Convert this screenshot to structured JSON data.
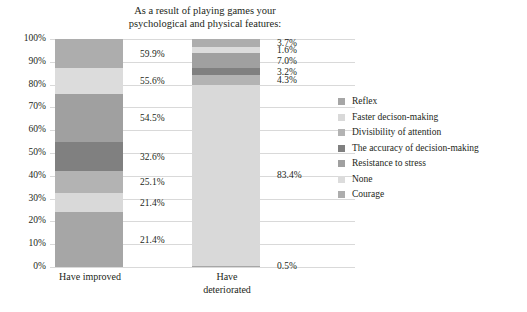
{
  "chart_data": {
    "type": "bar",
    "subtype": "stacked-100-percent",
    "title": "As a result of playing games your psychological and physical features:",
    "title_lines": [
      "As a result of playing games your",
      "psychological and physical features:"
    ],
    "categories": [
      "Have improved",
      "Have deteriorated"
    ],
    "category_lines": [
      [
        "Have improved"
      ],
      [
        "Have",
        "deteriorated"
      ]
    ],
    "xlabel": "",
    "ylabel": "",
    "ylim": [
      0,
      100
    ],
    "ytick_labels": [
      "0%",
      "10%",
      "20%",
      "30%",
      "40%",
      "50%",
      "60%",
      "70%",
      "80%",
      "90%",
      "100%"
    ],
    "ytick_values": [
      0,
      10,
      20,
      30,
      40,
      50,
      60,
      70,
      80,
      90,
      100
    ],
    "grid": true,
    "legend_position": "right",
    "note": "Each bar is normalized to 100%; printed labels are the raw response percentages.",
    "series": [
      {
        "name": "Reflex",
        "color": "#a6a6a6",
        "values": [
          21.4,
          0.5
        ],
        "labels": [
          "21.4%",
          "0.5%"
        ],
        "shares": [
          24.0,
          0.5
        ]
      },
      {
        "name": "Faster decison-making",
        "color": "#d9d9d9",
        "values": [
          21.4,
          83.4
        ],
        "labels": [
          "21.4%",
          "83.4%"
        ],
        "shares": [
          8.3,
          79.5
        ]
      },
      {
        "name": "Divisibility of attention",
        "color": "#b3b3b3",
        "values": [
          25.1,
          4.3
        ],
        "labels": [
          "25.1%",
          "4.3%"
        ],
        "shares": [
          9.8,
          4.1
        ]
      },
      {
        "name": "The accuracy of decision-making",
        "color": "#808080",
        "values": [
          32.6,
          3.2
        ],
        "labels": [
          "32.6%",
          "3.2%"
        ],
        "shares": [
          12.7,
          3.1
        ]
      },
      {
        "name": "Resistance to stress",
        "color": "#a0a0a0",
        "values": [
          54.5,
          7.0
        ],
        "labels": [
          "54.5%",
          "7.0%"
        ],
        "shares": [
          21.2,
          6.7
        ]
      },
      {
        "name": "None",
        "color": "#dcdcdc",
        "values": [
          55.6,
          1.6
        ],
        "labels": [
          "55.6%",
          "1.6%"
        ],
        "shares": [
          11.2,
          2.5
        ]
      },
      {
        "name": "Courage",
        "color": "#adadad",
        "values": [
          59.9,
          3.7
        ],
        "labels": [
          "59.9%",
          "3.7%"
        ],
        "shares": [
          12.8,
          3.6
        ]
      }
    ]
  },
  "legend": {
    "items": [
      {
        "label": "Reflex",
        "color": "#a6a6a6"
      },
      {
        "label": "Faster decison-making",
        "color": "#d9d9d9"
      },
      {
        "label": "Divisibility of attention",
        "color": "#b3b3b3"
      },
      {
        "label": "The accuracy of decision-making",
        "color": "#808080"
      },
      {
        "label": "Resistance to stress",
        "color": "#a0a0a0"
      },
      {
        "label": "None",
        "color": "#dcdcdc"
      },
      {
        "label": "Courage",
        "color": "#adadad"
      }
    ]
  },
  "style": {
    "gridline_color": "#d9d9d9",
    "text_color": "#231f20",
    "background": "#ffffff"
  }
}
